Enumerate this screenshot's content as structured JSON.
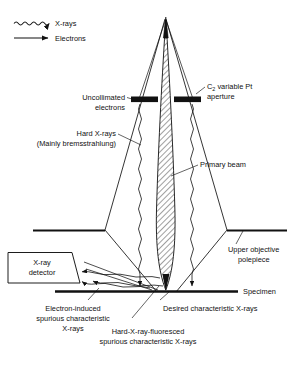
{
  "figure": {
    "background_color": "#ffffff",
    "line_color": "#111111",
    "fill_hatched": "primary-beam-hatch"
  },
  "legend": {
    "items": [
      {
        "id": "xrays",
        "label": "X-rays",
        "marker": "wavy-arrow-icon"
      },
      {
        "id": "electrons",
        "label": "Electrons",
        "marker": "straight-arrow-icon"
      }
    ]
  },
  "labels": {
    "uncollimated_electrons_l1": "Uncollimated",
    "uncollimated_electrons_l2": "electrons",
    "hard_xrays_l1": "Hard X-rays",
    "hard_xrays_l2": "(Mainly bremsstrahlung)",
    "c2_aperture_l1_pre": "C",
    "c2_aperture_l1_sub": "2",
    "c2_aperture_l1_post": " variable Pt",
    "c2_aperture_l2": "aperture",
    "primary_beam": "Primary beam",
    "upper_objective_l1": "Upper objective",
    "upper_objective_l2": "polepiece",
    "specimen": "Specimen",
    "xray_detector_l1": "X-ray",
    "xray_detector_l2": "detector",
    "electron_induced_l1": "Electron-induced",
    "electron_induced_l2": "spurious characteristic",
    "electron_induced_l3": "X-rays",
    "desired_char_xrays": "Desired characteristic X-rays",
    "hard_fluoresced_l1": "Hard-X-ray-fluoresced",
    "hard_fluoresced_l2": "spurious characteristic X-rays"
  }
}
